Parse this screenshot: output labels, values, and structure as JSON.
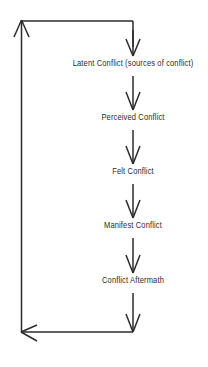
{
  "diagram": {
    "type": "cyclical-flowchart",
    "background_color": "#ffffff",
    "line_color": "#2b2b2b",
    "text_color": "#2b2b2b",
    "stages": [
      {
        "id": "latent",
        "label": "Latent Conflict (sources of conflict)",
        "center_x": 133,
        "center_y": 64
      },
      {
        "id": "perceived",
        "label": "Perceived Conflict",
        "center_x": 133,
        "center_y": 118
      },
      {
        "id": "felt",
        "label": "Felt Conflict",
        "center_x": 133,
        "center_y": 172
      },
      {
        "id": "manifest",
        "label": "Manifest Conflict",
        "center_x": 133,
        "center_y": 226
      },
      {
        "id": "aftermath",
        "label": "Conflict Aftermath",
        "center_x": 133,
        "center_y": 281
      }
    ],
    "connectors": [
      {
        "id": "arrow-into-latent",
        "from": "top-entry",
        "to": "latent",
        "direction": "down"
      },
      {
        "id": "arrow-latent-to-perceived",
        "from": "latent",
        "to": "perceived",
        "direction": "down"
      },
      {
        "id": "arrow-perceived-to-felt",
        "from": "perceived",
        "to": "felt",
        "direction": "down"
      },
      {
        "id": "arrow-felt-to-manifest",
        "from": "felt",
        "to": "manifest",
        "direction": "down"
      },
      {
        "id": "arrow-manifest-to-aftermath",
        "from": "manifest",
        "to": "aftermath",
        "direction": "down"
      },
      {
        "id": "arrow-aftermath-to-feedback",
        "from": "aftermath",
        "to": "bottom-rail",
        "direction": "down"
      }
    ],
    "feedback_loop": {
      "id": "feedback-loop",
      "description": "Conflict Aftermath feeds back to Latent Conflict",
      "bottom_arrow_direction": "left",
      "top_arrow_direction": "up"
    }
  }
}
